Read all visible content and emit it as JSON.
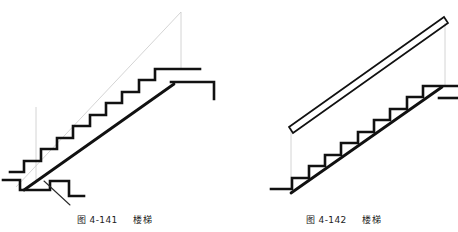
{
  "page": {
    "background_color": "#ffffff",
    "width": 458,
    "height": 232
  },
  "style": {
    "outline_color": "#111111",
    "construction_line_color": "#c9c9c9",
    "leader_line_color": "#2b2b2b",
    "caption_color": "#1b1b1b",
    "outline_width": 2.6,
    "construction_width": 0.7,
    "handrail_width": 1.6
  },
  "figures": [
    {
      "id": "figure-left",
      "name": "stair-without-handrail",
      "caption": {
        "number": "图 4-141",
        "label": "楼梯",
        "full": "图 4-141  楼梯"
      },
      "description": "Side elevation of a staircase drawn without a handrail, showing a stepped profile, inclined stringer and light grey construction lines forming the layout triangle.",
      "elements": {
        "construction_triangle": "faint grey diagonal from lower-left to upper-right apex with a vertical drop line",
        "step_count": 8,
        "stringer": "thick inclined line following the underside of the treads",
        "landing": "upper landing at top right with a return nosing",
        "base_detail": "stepped bottom landing with notch and leader line",
        "leader_line": "thin diagonal pointer at the base step"
      },
      "geometry": {
        "construction": {
          "diagonal": [
            [
              16,
              186
            ],
            [
              181,
              13
            ]
          ],
          "vertical": [
            [
              181,
              13
            ],
            [
              181,
              68
            ]
          ],
          "drop": [
            [
              36,
              108
            ],
            [
              36,
              181
            ]
          ]
        },
        "steps": {
          "origin": [
            18,
            186
          ],
          "run": 16.4,
          "rise": 11.6,
          "count": 8
        },
        "stringer": [
          [
            22,
            190
          ],
          [
            186,
            74
          ]
        ],
        "top_landing": {
          "riser_top": [
            [
              167,
              68
            ],
            [
              200,
              68
            ]
          ],
          "return": [
            [
              200,
              68
            ],
            [
              200,
              82
            ]
          ],
          "nose": [
            [
              200,
              82
            ],
            [
              214,
              82
            ]
          ],
          "drop": [
            [
              214,
              82
            ],
            [
              214,
              98
            ]
          ]
        },
        "base": {
          "shelf": [
            [
              10,
              172
            ],
            [
              47,
              172
            ]
          ],
          "lower_shelf": [
            [
              3,
              180
            ],
            [
              22,
              180
            ]
          ],
          "notch": [
            [
              22,
              180
            ],
            [
              22,
              190
            ],
            [
              53,
              190
            ],
            [
              53,
              180
            ],
            [
              70,
              180
            ],
            [
              70,
              196
            ],
            [
              84,
              196
            ]
          ],
          "leader": [
            [
              46,
              182
            ],
            [
              72,
              205
            ]
          ]
        }
      }
    },
    {
      "id": "figure-right",
      "name": "stair-with-handrail",
      "caption": {
        "number": "图 4-142",
        "label": "楼梯",
        "full": "图 4-142  楼梯"
      },
      "description": "Side elevation of the same staircase drawn with an inclined double-line handrail above the flight, joined to the stair by light grey vertical construction lines.",
      "elements": {
        "handrail": "double parallel inclined lines representing the rail, closed at both ends",
        "step_count": 8,
        "stringer": "thick inclined line following the underside of the treads",
        "balusters": "two light grey vertical construction lines connecting the handrail to the stair",
        "base_detail": "flat bottom landing step"
      },
      "geometry": {
        "handrail": {
          "lower_end": [
            [
              60,
              127
            ],
            [
              66,
              120
            ]
          ],
          "upper_end": [
            [
              214,
              17
            ],
            [
              219,
              24
            ]
          ],
          "top_line": [
            [
              63,
              122
            ],
            [
              217,
              19
            ]
          ],
          "bottom_line": [
            [
              63,
              129
            ],
            [
              217,
              26
            ]
          ]
        },
        "construction": {
          "left_post": [
            [
              62,
              128
            ],
            [
              62,
              188
            ]
          ],
          "right_post": [
            [
              216,
              22
            ],
            [
              216,
              86
            ]
          ]
        },
        "steps": {
          "origin": [
            57,
            189
          ],
          "run": 16.4,
          "rise": 11.6,
          "count": 8
        },
        "stringer": [
          [
            60,
            193
          ],
          [
            224,
            77
          ]
        ],
        "base": {
          "shelf": [
            [
              42,
              189
            ],
            [
              62,
              189
            ]
          ]
        },
        "top_landing": {
          "riser_top": [
            [
              205,
              86
            ],
            [
              229,
              86
            ]
          ],
          "nose": [
            [
              205,
              98
            ],
            [
              229,
              98
            ]
          ]
        }
      }
    }
  ]
}
